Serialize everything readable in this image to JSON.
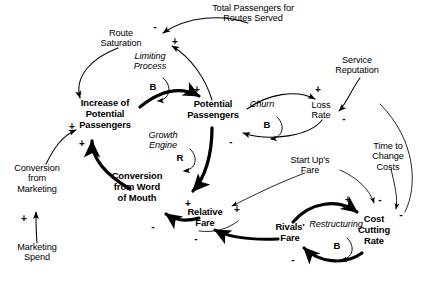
{
  "diagram": {
    "type": "causal-loop-diagram",
    "width": 427,
    "height": 282,
    "background_color": "#ffffff",
    "ink_color": "#000000"
  },
  "variables": [
    {
      "id": "route_saturation",
      "label": "Route\nSaturation",
      "style": "plain",
      "x": 121,
      "y": 33,
      "w": 70
    },
    {
      "id": "total_passengers",
      "label": "Total Passengers for\nRoutes Served",
      "style": "plain",
      "x": 253,
      "y": 8,
      "w": 120
    },
    {
      "id": "service_reputation",
      "label": "Service\nReputation",
      "style": "plain",
      "x": 357,
      "y": 60,
      "w": 70
    },
    {
      "id": "increase_potential",
      "label": "Increase of\nPotential\nPassengers",
      "style": "bold",
      "x": 105,
      "y": 103,
      "w": 78
    },
    {
      "id": "potential_passengers",
      "label": "Potential\nPassengers",
      "style": "bold",
      "x": 213,
      "y": 104,
      "w": 72
    },
    {
      "id": "loss_rate",
      "label": "Loss\nRate",
      "style": "plain",
      "x": 321,
      "y": 105,
      "w": 40
    },
    {
      "id": "conversion_marketing",
      "label": "Conversion\nfrom\nMarketing",
      "style": "plain",
      "x": 37,
      "y": 168,
      "w": 72
    },
    {
      "id": "marketing_spend",
      "label": "Marketing\nSpend",
      "style": "plain",
      "x": 37,
      "y": 247,
      "w": 66
    },
    {
      "id": "conversion_word_mouth",
      "label": "Conversion\nfrom Word\nof Mouth",
      "style": "bold",
      "x": 137,
      "y": 176,
      "w": 82
    },
    {
      "id": "relative_fare",
      "label": "Relative\nFare",
      "style": "bold",
      "x": 205,
      "y": 212,
      "w": 58
    },
    {
      "id": "rivals_fare",
      "label": "Rivals'\nFare",
      "style": "bold",
      "x": 290,
      "y": 227,
      "w": 46
    },
    {
      "id": "start_ups_fare",
      "label": "Start Up's\nFare",
      "style": "plain",
      "x": 310,
      "y": 160,
      "w": 62
    },
    {
      "id": "cost_cutting_rate",
      "label": "Cost\nCutting\nRate",
      "style": "bold",
      "x": 374,
      "y": 219,
      "w": 48
    },
    {
      "id": "time_to_change_costs",
      "label": "Time to\nChange\nCosts",
      "style": "plain",
      "x": 388,
      "y": 146,
      "w": 54
    }
  ],
  "loops": [
    {
      "id": "limiting_process",
      "name": "Limiting\nProcess",
      "mark": "B",
      "name_x": 150,
      "name_y": 56,
      "mark_x": 153,
      "mark_y": 86,
      "kind": "balancing"
    },
    {
      "id": "growth_engine",
      "name": "Growth\nEngine",
      "mark": "R",
      "name_x": 163,
      "name_y": 135,
      "mark_x": 180,
      "mark_y": 157,
      "kind": "reinforcing"
    },
    {
      "id": "churn",
      "name": "Churn",
      "mark": "B",
      "name_x": 262,
      "name_y": 104,
      "mark_x": 267,
      "mark_y": 124,
      "kind": "balancing"
    },
    {
      "id": "restructuring",
      "name": "Restructuring",
      "mark": "B",
      "name_x": 336,
      "name_y": 224,
      "mark_x": 337,
      "mark_y": 245,
      "kind": "balancing"
    }
  ],
  "links": [
    {
      "id": "l1",
      "from": "total_passengers",
      "to": "route_saturation",
      "sign": "-",
      "weight": "thin",
      "sign_x": 155,
      "sign_y": 26
    },
    {
      "id": "l2",
      "from": "potential_passengers",
      "to": "route_saturation",
      "sign": "+",
      "weight": "thin",
      "sign_x": 175,
      "sign_y": 41
    },
    {
      "id": "l3",
      "from": "route_saturation",
      "to": "increase_potential",
      "sign": "-",
      "weight": "thin",
      "sign_x": 80,
      "sign_y": 92
    },
    {
      "id": "l4",
      "from": "increase_potential",
      "to": "potential_passengers",
      "sign": "+",
      "weight": "thick",
      "sign_x": 197,
      "sign_y": 89
    },
    {
      "id": "l5",
      "from": "potential_passengers",
      "to": "loss_rate",
      "sign": "+",
      "weight": "thin",
      "sign_x": 318,
      "sign_y": 89
    },
    {
      "id": "l6",
      "from": "loss_rate",
      "to": "potential_passengers",
      "sign": "-",
      "weight": "thin",
      "sign_x": 231,
      "sign_y": 141
    },
    {
      "id": "l7",
      "from": "service_reputation",
      "to": "loss_rate",
      "sign": "-",
      "weight": "thin",
      "sign_x": 344,
      "sign_y": 118
    },
    {
      "id": "l8",
      "from": "conversion_marketing",
      "to": "increase_potential",
      "sign": "+",
      "weight": "thin",
      "sign_x": 72,
      "sign_y": 126
    },
    {
      "id": "l9",
      "from": "marketing_spend",
      "to": "conversion_marketing",
      "sign": "+",
      "weight": "thin",
      "sign_x": 24,
      "sign_y": 218
    },
    {
      "id": "l10",
      "from": "conversion_word_mouth",
      "to": "increase_potential",
      "sign": "+",
      "weight": "thick",
      "sign_x": 82,
      "sign_y": 143
    },
    {
      "id": "l11",
      "from": "potential_passengers",
      "to": "conversion_word_mouth",
      "sign": "+",
      "weight": "thick",
      "sign_x": 188,
      "sign_y": 203
    },
    {
      "id": "l12",
      "from": "relative_fare",
      "to": "conversion_word_mouth",
      "sign": "-",
      "weight": "thick",
      "sign_x": 153,
      "sign_y": 226
    },
    {
      "id": "l13",
      "from": "rivals_fare",
      "to": "relative_fare",
      "sign": "-",
      "weight": "thick",
      "sign_x": 196,
      "sign_y": 238
    },
    {
      "id": "l14",
      "from": "start_ups_fare",
      "to": "relative_fare",
      "sign": "",
      "weight": "thin",
      "sign_x": 0,
      "sign_y": 0
    },
    {
      "id": "l15",
      "from": "relative_fare",
      "to": "rivals_fare",
      "sign": "+",
      "weight": "thin",
      "sign_x": 237,
      "sign_y": 209
    },
    {
      "id": "l16",
      "from": "rivals_fare",
      "to": "cost_cutting_rate",
      "sign": "+",
      "weight": "thick",
      "sign_x": 348,
      "sign_y": 199
    },
    {
      "id": "l17",
      "from": "cost_cutting_rate",
      "to": "rivals_fare",
      "sign": "-",
      "weight": "thick",
      "sign_x": 293,
      "sign_y": 259
    },
    {
      "id": "l18",
      "from": "start_ups_fare",
      "to": "cost_cutting_rate",
      "sign": "-",
      "weight": "thin",
      "sign_x": 380,
      "sign_y": 199
    },
    {
      "id": "l19",
      "from": "time_to_change_costs",
      "to": "cost_cutting_rate",
      "sign": "-",
      "weight": "thin",
      "sign_x": 400,
      "sign_y": 214
    },
    {
      "id": "l20",
      "from": "cost_cutting_rate",
      "to": "service_reputation",
      "sign": "",
      "weight": "thin",
      "sign_x": 0,
      "sign_y": 0
    }
  ]
}
